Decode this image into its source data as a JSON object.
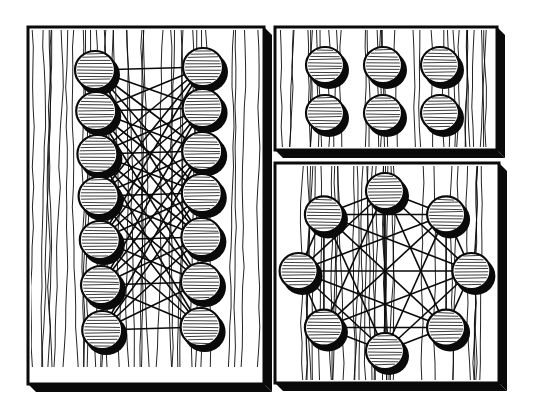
{
  "illustration": {
    "title": "Peg boards connected by strings",
    "style": "black-and-white woodcut",
    "colors": {
      "ink": "#0a0a0a",
      "paper": "#ffffff"
    },
    "boards": [
      {
        "id": "left-board",
        "description": "Two columns of 7 pegs, every left peg strung to many right pegs (bipartite network)",
        "x": 28,
        "y": 27,
        "w": 236,
        "h": 357,
        "depth": 8,
        "peg_rows": 7,
        "peg_cols": 2,
        "columns_x": [
          95,
          203
        ],
        "rows_y": [
          70,
          111,
          154,
          196,
          240,
          285,
          330
        ],
        "peg_radius": 20
      },
      {
        "id": "top-right-board",
        "description": "Grid of 6 unconnected pegs (2 rows x 3 columns)",
        "x": 275,
        "y": 27,
        "w": 222,
        "h": 123,
        "depth": 8,
        "peg_rows": 2,
        "peg_cols": 3,
        "columns_x": [
          325,
          383,
          440
        ],
        "rows_y": [
          65,
          113
        ],
        "peg_radius": 19
      },
      {
        "id": "bottom-right-board",
        "description": "8 pegs arranged in a circle, every peg connected to every other (complete graph)",
        "x": 275,
        "y": 163,
        "w": 224,
        "h": 220,
        "depth": 8,
        "peg_count": 8,
        "center_x": 385,
        "center_y": 271,
        "ring_radius": 80,
        "peg_radius": 19
      }
    ]
  }
}
